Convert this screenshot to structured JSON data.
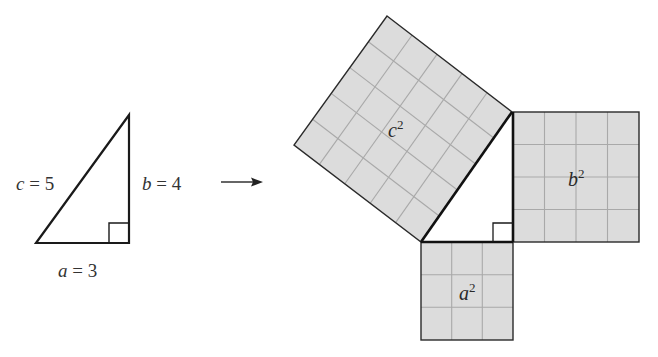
{
  "colors": {
    "fill": "#dcdcdc",
    "grid": "#a9a9a9",
    "stroke": "#1a1a1a",
    "text": "#333333"
  },
  "small_triangle": {
    "side_c": {
      "var": "c",
      "eq": " = 5"
    },
    "side_b": {
      "var": "b",
      "eq": " = 4"
    },
    "side_a": {
      "var": "a",
      "eq": " = 3"
    },
    "right_angle_marker": true
  },
  "arrow": {
    "direction": "right"
  },
  "squares": {
    "c_square": {
      "var": "c",
      "exp": "2",
      "grid": 5
    },
    "b_square": {
      "var": "b",
      "exp": "2",
      "grid": 4
    },
    "a_square": {
      "var": "a",
      "exp": "2",
      "grid": 3
    }
  }
}
